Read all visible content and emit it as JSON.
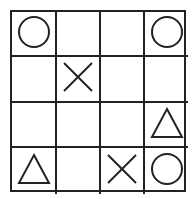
{
  "board": {
    "rows": 4,
    "cols": 4,
    "line_color": "#222222",
    "cells": [
      [
        "circle",
        "",
        "",
        "circle"
      ],
      [
        "",
        "cross",
        "",
        ""
      ],
      [
        "",
        "",
        "",
        "triangle"
      ],
      [
        "triangle",
        "",
        "cross",
        "circle"
      ]
    ]
  }
}
